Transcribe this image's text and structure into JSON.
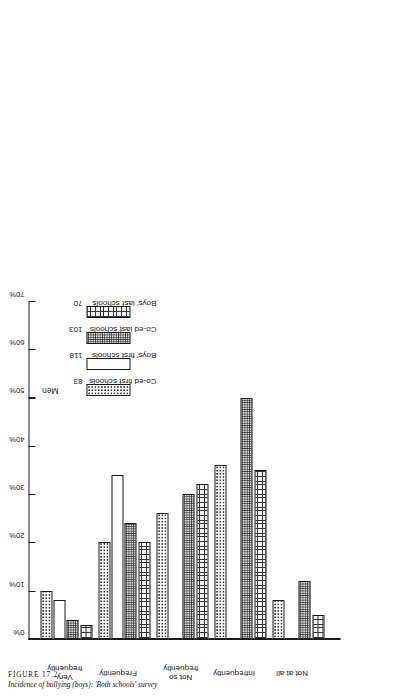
{
  "caption": {
    "figure_number": "FIGURE 17.2",
    "title": "Incidence of bullying (boys): 'Both schools' survey"
  },
  "legend": {
    "title": "Men",
    "items": [
      {
        "label": "Co-ed first schools",
        "value": "83",
        "pattern": "p-coedfirst"
      },
      {
        "label": "Boys' first schools",
        "value": "118",
        "pattern": "p-boysfirst"
      },
      {
        "label": "Co-ed last schools",
        "value": "103",
        "pattern": "p-coedlast"
      },
      {
        "label": "Boys' last schools",
        "value": "70",
        "pattern": "p-boyslast"
      }
    ]
  },
  "axis": {
    "ticks": [
      "0%",
      "10%",
      "20%",
      "30%",
      "40%",
      "50%",
      "60%",
      "70%"
    ],
    "tick_values": [
      0,
      10,
      20,
      30,
      40,
      50,
      60,
      70
    ],
    "max": 70,
    "secondary_ticks": [
      "0%",
      "10%",
      "20%",
      "30%",
      "40%",
      "53%",
      "60%"
    ]
  },
  "chart_data": {
    "type": "bar",
    "title": "Incidence of bullying (boys): 'Both schools' survey",
    "xlabel": "",
    "ylabel": "",
    "ylim": [
      0,
      70
    ],
    "grid": false,
    "legend_position": "inside-left",
    "orientation": "horizontal-rotated",
    "categories": [
      "Very frequently",
      "Frequently",
      "Not so frequently",
      "Infrequently",
      "Not at all"
    ],
    "series": [
      {
        "name": "Co-ed first schools",
        "n": 83,
        "values": [
          10,
          20,
          26,
          36,
          8
        ]
      },
      {
        "name": "Boys' first schools",
        "n": 118,
        "values": [
          8,
          34,
          0,
          0,
          0
        ]
      },
      {
        "name": "Co-ed last schools",
        "n": 103,
        "values": [
          4,
          24,
          30,
          50,
          12
        ]
      },
      {
        "name": "Boys' last schools",
        "n": 70,
        "values": [
          3,
          20,
          32,
          35,
          5
        ]
      }
    ]
  }
}
